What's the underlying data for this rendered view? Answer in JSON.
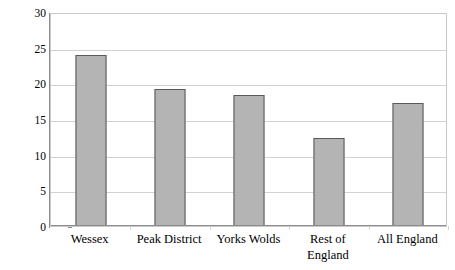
{
  "chart_data": {
    "type": "bar",
    "title": "",
    "subtitle": "",
    "xlabel": "",
    "ylabel": "% of total graves in region",
    "categories": [
      "Wessex",
      "Peak District",
      "Yorks Wolds",
      "Rest of England",
      "All England"
    ],
    "category_lines": [
      [
        "Wessex"
      ],
      [
        "Peak District"
      ],
      [
        "Yorks Wolds"
      ],
      [
        "Rest of",
        "England"
      ],
      [
        "All England"
      ]
    ],
    "values": [
      24.0,
      19.2,
      18.3,
      12.3,
      17.3
    ],
    "ylim": [
      0,
      30
    ],
    "ytick_step": 5,
    "yticks": [
      0,
      5,
      10,
      15,
      20,
      25,
      30
    ],
    "ytick_labels": [
      "0",
      "5",
      "10",
      "15",
      "20",
      "25",
      "30"
    ],
    "grid": true,
    "grid_axis": "y",
    "legend": false,
    "legend_position": "none",
    "bar_fill_color": "#b4b4b4",
    "bar_border_color": "#595959",
    "gridline_color": "#d2d2d2",
    "axis_line_color": "#8d8d8d",
    "plot_border_color": "#c9c9c9",
    "background_color": "#ffffff",
    "text_color": "#000000"
  }
}
